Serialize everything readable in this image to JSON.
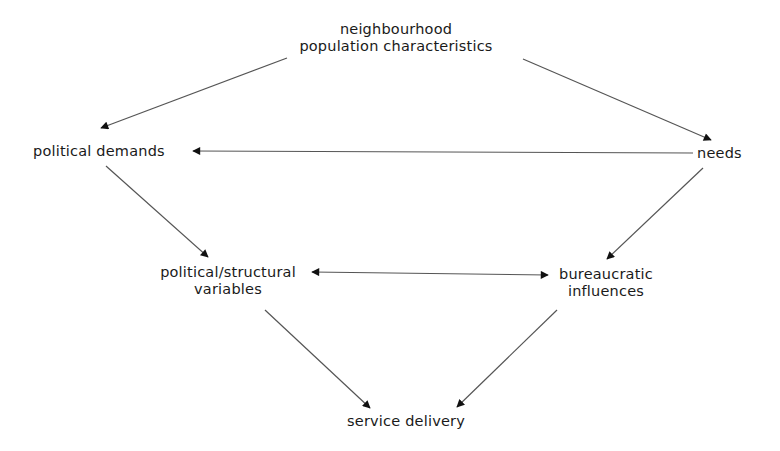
{
  "diagram": {
    "nodes": {
      "population": {
        "lines": [
          "neighbourhood",
          "population characteristics"
        ]
      },
      "political_demands": {
        "lines": [
          "political demands"
        ]
      },
      "needs": {
        "lines": [
          "needs"
        ]
      },
      "political_structural": {
        "lines": [
          "political/structural",
          "variables"
        ]
      },
      "bureaucratic": {
        "lines": [
          "bureaucratic",
          "influences"
        ]
      },
      "service_delivery": {
        "lines": [
          "service delivery"
        ]
      }
    },
    "edges": [
      {
        "from": "population",
        "to": "political_demands",
        "direction": "forward"
      },
      {
        "from": "population",
        "to": "needs",
        "direction": "forward"
      },
      {
        "from": "needs",
        "to": "political_demands",
        "direction": "forward"
      },
      {
        "from": "political_demands",
        "to": "political_structural",
        "direction": "forward"
      },
      {
        "from": "needs",
        "to": "bureaucratic",
        "direction": "forward"
      },
      {
        "from": "political_structural",
        "to": "bureaucratic",
        "direction": "bidirectional"
      },
      {
        "from": "political_structural",
        "to": "service_delivery",
        "direction": "forward"
      },
      {
        "from": "bureaucratic",
        "to": "service_delivery",
        "direction": "forward"
      }
    ],
    "colors": {
      "line": "#555555",
      "arrowhead": "#111111",
      "text": "#1a1a1a"
    }
  }
}
